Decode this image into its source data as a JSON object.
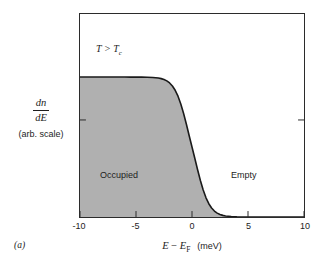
{
  "figure": {
    "panel_letter": "(a)",
    "annotations": {
      "temperature_main": "T",
      "temperature_relation": " > ",
      "temperature_symbol": "T",
      "temperature_subscript": "c",
      "occupied": "Occupied",
      "empty": "Empty"
    },
    "yaxis": {
      "numerator": "dn",
      "denominator": "dE",
      "scale_note": "(arb. scale)"
    },
    "xaxis": {
      "symbol_e": "E",
      "minus": " − ",
      "symbol_ef": "E",
      "symbol_ef_sub": "F",
      "units": "(meV)"
    }
  },
  "chart_data": {
    "type": "line",
    "title": "",
    "subtitle": "",
    "xlabel": "E − E_F (meV)",
    "ylabel": "dn/dE (arb. scale)",
    "xlim": [
      -10,
      10
    ],
    "ylim": [
      0,
      1.45
    ],
    "xticks": [
      -10,
      -5,
      0,
      5,
      10
    ],
    "xticklabels": [
      "-10",
      "-5",
      "0",
      "5",
      "10"
    ],
    "yticks": [
      1.0
    ],
    "yticklabels": [
      ""
    ],
    "grid": false,
    "legend": false,
    "fill_color": "#b0b0b0",
    "line_color": "#1a1a1a",
    "frame_color": "#2b2b2b",
    "annotations": [
      {
        "text": "T > T_c",
        "x": -5.5,
        "y": 1.22
      },
      {
        "text": "Occupied",
        "x": -5.4,
        "y": 0.43
      },
      {
        "text": "Empty",
        "x": 3.5,
        "y": 0.43
      }
    ],
    "series": [
      {
        "name": "Fermi-Dirac occupied density of states",
        "kT_meV": 0.62,
        "plateau": 1.0,
        "x": [
          -10,
          -9.5,
          -9,
          -8.5,
          -8,
          -7.5,
          -7,
          -6.5,
          -6,
          -5.5,
          -5,
          -4.5,
          -4,
          -3.5,
          -3,
          -2.75,
          -2.5,
          -2.25,
          -2,
          -1.75,
          -1.5,
          -1.25,
          -1,
          -0.75,
          -0.5,
          -0.25,
          0,
          0.25,
          0.5,
          0.75,
          1,
          1.25,
          1.5,
          1.75,
          2,
          2.25,
          2.5,
          2.75,
          3,
          3.5,
          4,
          4.5,
          5,
          6,
          7,
          8,
          9,
          10
        ],
        "values": [
          1.0,
          1.0,
          1.0,
          1.0,
          1.0,
          1.0,
          1.0,
          1.0,
          1.0,
          0.999,
          0.9997,
          0.9993,
          0.9985,
          0.9966,
          0.9925,
          0.9884,
          0.982,
          0.9722,
          0.9575,
          0.9359,
          0.9051,
          0.8628,
          0.8076,
          0.7398,
          0.6623,
          0.5805,
          0.5,
          0.4195,
          0.3377,
          0.2602,
          0.1924,
          0.1372,
          0.0949,
          0.0641,
          0.0425,
          0.0278,
          0.018,
          0.0116,
          0.0075,
          0.0031,
          0.0013,
          0.00054,
          0.00022,
          4e-05,
          7e-06,
          1.2e-06,
          2e-07,
          0.0
        ]
      }
    ]
  }
}
